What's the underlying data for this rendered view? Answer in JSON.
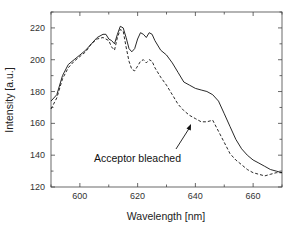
{
  "chart_data": {
    "type": "line",
    "title": "",
    "xlabel": "Wavelength [nm]",
    "ylabel": "Intensity [a.u.]",
    "xlim": [
      590,
      670
    ],
    "ylim": [
      120,
      230
    ],
    "xticks": [
      600,
      620,
      640,
      660
    ],
    "yticks": [
      120,
      140,
      160,
      180,
      200,
      220
    ],
    "grid": false,
    "legend": null,
    "annotations": [
      {
        "text": "Acceptor bleached",
        "arrow_to": [
          641,
          162
        ]
      }
    ],
    "series": [
      {
        "name": "before bleaching",
        "style": "solid",
        "color": "#111111",
        "x": [
          590,
          592,
          594,
          596,
          598,
          600,
          602,
          604,
          606,
          608,
          609,
          610,
          611,
          612,
          613,
          614,
          615,
          616,
          617,
          618,
          619,
          620,
          621,
          622,
          623,
          624,
          625,
          626,
          628,
          630,
          632,
          634,
          636,
          638,
          640,
          642,
          644,
          646,
          648,
          650,
          652,
          654,
          656,
          658,
          660,
          662,
          664,
          666,
          668,
          670
        ],
        "y": [
          174,
          178,
          190,
          197,
          200,
          203,
          206,
          210,
          214,
          216,
          216,
          213,
          212,
          210,
          216,
          221,
          220,
          214,
          207,
          205,
          207,
          213,
          217,
          216,
          214,
          217,
          216,
          212,
          206,
          203,
          198,
          192,
          186,
          184,
          182,
          181,
          180,
          178,
          174,
          166,
          158,
          150,
          144,
          140,
          137,
          135,
          133,
          131,
          130,
          129
        ]
      },
      {
        "name": "acceptor bleached",
        "style": "dashed",
        "color": "#111111",
        "x": [
          590,
          592,
          594,
          596,
          598,
          600,
          602,
          604,
          606,
          608,
          610,
          611,
          612,
          613,
          614,
          615,
          616,
          617,
          618,
          619,
          620,
          621,
          622,
          623,
          624,
          625,
          626,
          628,
          630,
          632,
          634,
          636,
          638,
          640,
          642,
          644,
          646,
          648,
          650,
          652,
          654,
          656,
          658,
          660,
          662,
          664,
          666,
          668,
          670
        ],
        "y": [
          169,
          176,
          188,
          195,
          199,
          202,
          205,
          210,
          213,
          214,
          212,
          208,
          206,
          214,
          219,
          218,
          208,
          199,
          194,
          193,
          196,
          199,
          200,
          198,
          200,
          199,
          195,
          189,
          184,
          178,
          172,
          168,
          165,
          163,
          161,
          161,
          162,
          155,
          148,
          141,
          137,
          134,
          131,
          129,
          128,
          127,
          128,
          129,
          129
        ]
      }
    ]
  },
  "labels": {
    "xlabel": "Wavelength [nm]",
    "ylabel": "Intensity [a.u.]",
    "annotation": "Acceptor bleached",
    "xticks": [
      "600",
      "620",
      "640",
      "660"
    ],
    "yticks": [
      "120",
      "140",
      "160",
      "180",
      "200",
      "220"
    ]
  }
}
